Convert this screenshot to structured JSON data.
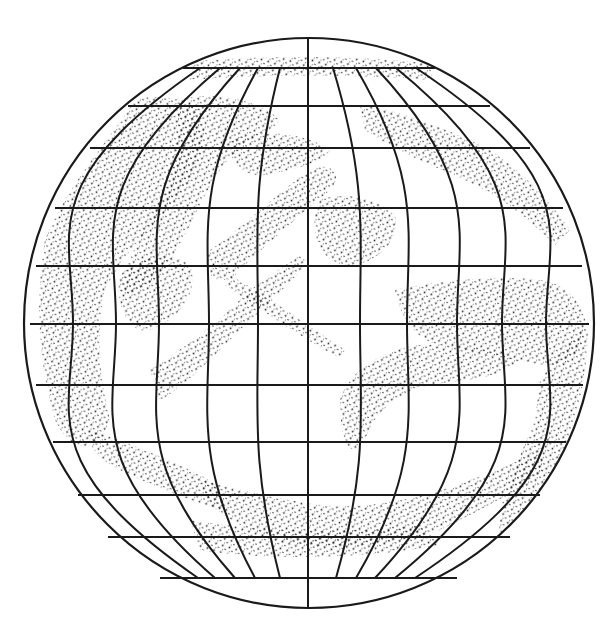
{
  "figure": {
    "type": "globe-graticule-diagram",
    "background": "#ffffff",
    "ink_color": "#1a1a1a",
    "stipple_color": "#2a2a2a",
    "globe": {
      "cx": 309,
      "cy": 323,
      "r": 285
    },
    "parallels": [
      {
        "y": 68,
        "x1": 183,
        "x2": 435
      },
      {
        "y": 106,
        "x1": 128,
        "x2": 490
      },
      {
        "y": 148,
        "x1": 90,
        "x2": 530
      },
      {
        "y": 208,
        "x1": 55,
        "x2": 563
      },
      {
        "y": 266,
        "x1": 36,
        "x2": 582
      },
      {
        "y": 324,
        "x1": 30,
        "x2": 589
      },
      {
        "y": 385,
        "x1": 36,
        "x2": 583
      },
      {
        "y": 442,
        "x1": 53,
        "x2": 566
      },
      {
        "y": 495,
        "x1": 78,
        "x2": 540
      },
      {
        "y": 537,
        "x1": 108,
        "x2": 510
      },
      {
        "y": 578,
        "x1": 160,
        "x2": 457
      }
    ],
    "meridians": [
      {
        "top": 200,
        "mid": 73,
        "bot": 198
      },
      {
        "top": 220,
        "mid": 116,
        "bot": 215
      },
      {
        "top": 240,
        "mid": 159,
        "bot": 235
      },
      {
        "top": 258,
        "mid": 209,
        "bot": 255
      },
      {
        "top": 280,
        "mid": 258,
        "bot": 280
      },
      {
        "top": 309,
        "mid": 308,
        "bot": 309,
        "full": true
      },
      {
        "top": 333,
        "mid": 360,
        "bot": 336
      },
      {
        "top": 356,
        "mid": 407,
        "bot": 356
      },
      {
        "top": 376,
        "mid": 457,
        "bot": 375
      },
      {
        "top": 396,
        "mid": 502,
        "bot": 395
      },
      {
        "top": 416,
        "mid": 546,
        "bot": 415
      }
    ],
    "stippled_regions": [
      {
        "name": "north-polar-band",
        "d": "M190 62 C260 55 360 55 430 64 L432 80 C360 74 260 74 190 80 Z"
      },
      {
        "name": "northwest-landmass",
        "d": "M135 100 C110 140 70 180 45 240 C35 300 38 360 55 420 C70 450 95 460 110 420 C100 380 95 330 105 290 C125 250 150 230 175 200 C200 170 210 140 200 110 C180 95 150 95 135 100 Z"
      },
      {
        "name": "northwest-arm",
        "d": "M180 100 C210 90 260 100 280 120 C270 135 240 140 220 170 C200 200 190 230 170 260 C150 290 130 300 120 290 C125 260 150 220 170 180 C180 150 175 120 180 100 Z"
      },
      {
        "name": "west-mid-blob",
        "d": "M120 275 C140 255 170 250 190 265 C200 290 180 320 150 330 C125 335 115 300 120 275 Z"
      },
      {
        "name": "central-diagonal-ne",
        "d": "M210 250 C240 230 280 190 310 170 C330 160 345 175 330 190 C300 215 260 250 235 275 C215 290 200 270 210 250 Z"
      },
      {
        "name": "central-diagonal-sw",
        "d": "M150 370 C180 350 210 330 240 300 C260 280 280 270 300 255 L308 262 C290 285 260 310 235 335 C205 365 180 390 160 400 Z"
      },
      {
        "name": "central-diagonal-se",
        "d": "M230 275 C255 290 280 305 300 320 C315 330 330 340 345 350 L340 358 C320 348 300 335 280 322 C260 310 240 295 225 285 Z"
      },
      {
        "name": "north-center-band",
        "d": "M230 140 C260 130 300 130 330 150 C320 165 290 170 265 175 C245 178 225 160 230 140 Z"
      },
      {
        "name": "northeast-band",
        "d": "M360 105 C400 110 450 130 490 150 C520 170 550 200 570 230 L555 245 C530 220 500 195 465 180 C430 165 395 150 365 130 Z"
      },
      {
        "name": "east-center-blob",
        "d": "M320 200 C345 190 380 200 395 215 C400 240 380 260 355 265 C330 268 318 250 315 230 C314 215 315 205 320 200 Z"
      },
      {
        "name": "east-equatorial-band",
        "d": "M395 290 C440 280 500 275 540 280 C565 283 580 300 585 320 C585 350 570 370 545 365 C510 360 470 350 440 345 C420 342 400 320 395 290 Z"
      },
      {
        "name": "south-east-arc",
        "d": "M340 400 C350 370 380 350 420 345 C460 343 500 350 520 360 C500 380 460 380 430 385 C400 392 375 410 365 440 C355 460 340 450 340 400 Z"
      },
      {
        "name": "east-rim",
        "d": "M540 380 C560 350 585 330 588 320 C588 380 575 430 555 470 C540 500 520 520 500 535 C495 500 520 460 535 420 Z"
      },
      {
        "name": "south-center-band",
        "d": "M200 480 C240 490 280 500 320 505 C360 510 420 500 470 480 C500 470 520 460 540 450 L545 470 C520 490 480 510 440 530 C400 545 340 550 300 545 C260 540 230 520 210 505 Z"
      },
      {
        "name": "southwest-band",
        "d": "M90 430 C120 440 160 455 200 475 C220 485 230 500 220 510 C190 500 150 485 120 470 C100 460 85 445 90 430 Z"
      },
      {
        "name": "south-polar-band",
        "d": "M190 520 C250 530 330 535 420 525 L440 545 C360 560 260 560 200 550 Z"
      }
    ]
  }
}
